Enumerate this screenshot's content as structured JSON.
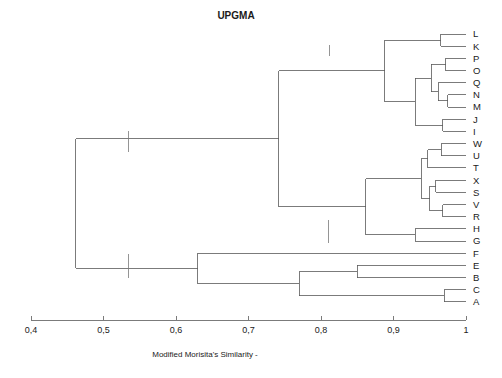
{
  "chart_data": {
    "type": "dendrogram",
    "title": "UPGMA",
    "xlabel": "Modified Morisita's Similarity -",
    "ylabel": "",
    "xlim": [
      0.4,
      1.0
    ],
    "xticks": [
      0.4,
      0.5,
      0.6,
      0.7,
      0.8,
      0.9,
      1.0
    ],
    "xtick_labels": [
      "0,4",
      "0,5",
      "0,6",
      "0,7",
      "0,8",
      "0,9",
      "1"
    ],
    "grid": false,
    "legend": "none",
    "axis_direction": "similarity-increasing-rightward",
    "leaves": [
      "L",
      "K",
      "P",
      "O",
      "Q",
      "N",
      "M",
      "J",
      "I",
      "W",
      "U",
      "T",
      "X",
      "S",
      "V",
      "R",
      "H",
      "G",
      "F",
      "E",
      "B",
      "C",
      "A"
    ],
    "leaf_count": 23,
    "merges": [
      {
        "id": "m_LK",
        "children": [
          "L",
          "K"
        ],
        "similarity": 0.965
      },
      {
        "id": "m_PO",
        "children": [
          "P",
          "O"
        ],
        "similarity": 0.972
      },
      {
        "id": "m_NM",
        "children": [
          "N",
          "M"
        ],
        "similarity": 0.975
      },
      {
        "id": "m_QNM",
        "children": [
          "Q",
          "m_NM"
        ],
        "similarity": 0.962
      },
      {
        "id": "m_PONM",
        "children": [
          "m_PO",
          "m_QNM"
        ],
        "similarity": 0.952
      },
      {
        "id": "m_JI",
        "children": [
          "J",
          "I"
        ],
        "similarity": 0.968
      },
      {
        "id": "m_PONMJI",
        "children": [
          "m_PONM",
          "m_JI"
        ],
        "similarity": 0.93
      },
      {
        "id": "m_IIa",
        "children": [
          "m_LK",
          "m_PONMJI"
        ],
        "similarity": 0.888
      },
      {
        "id": "m_WU",
        "children": [
          "W",
          "U"
        ],
        "similarity": 0.966
      },
      {
        "id": "m_WUT",
        "children": [
          "m_WU",
          "T"
        ],
        "similarity": 0.947
      },
      {
        "id": "m_XS",
        "children": [
          "X",
          "S"
        ],
        "similarity": 0.958
      },
      {
        "id": "m_VR",
        "children": [
          "V",
          "R"
        ],
        "similarity": 0.968
      },
      {
        "id": "m_XSVR",
        "children": [
          "m_XS",
          "m_VR"
        ],
        "similarity": 0.95
      },
      {
        "id": "m_WUTXSVR",
        "children": [
          "m_WUT",
          "m_XSVR"
        ],
        "similarity": 0.938
      },
      {
        "id": "m_HG",
        "children": [
          "H",
          "G"
        ],
        "similarity": 0.93
      },
      {
        "id": "m_IIb",
        "children": [
          "m_WUTXSVR",
          "m_HG"
        ],
        "similarity": 0.862
      },
      {
        "id": "m_II",
        "children": [
          "m_IIa",
          "m_IIb"
        ],
        "similarity": 0.742
      },
      {
        "id": "m_EB",
        "children": [
          "E",
          "B"
        ],
        "similarity": 0.85
      },
      {
        "id": "m_CA",
        "children": [
          "C",
          "A"
        ],
        "similarity": 0.97
      },
      {
        "id": "m_EBCA",
        "children": [
          "m_EB",
          "m_CA"
        ],
        "similarity": 0.77
      },
      {
        "id": "m_I",
        "children": [
          "F",
          "m_EBCA"
        ],
        "similarity": 0.63
      },
      {
        "id": "m_root",
        "children": [
          "m_II",
          "m_I"
        ],
        "similarity": 0.462
      }
    ],
    "annotations": [
      {
        "name": "group-ii-a",
        "text": "Group II a  \" Punta Carretas zone\"",
        "anchor_x": 0.812,
        "label_x": 0.7,
        "label_y_px": 42,
        "tick_y1_px": 45,
        "tick_y2_px": 56,
        "align": "middle"
      },
      {
        "name": "group-ii",
        "text": "Group II",
        "anchor_x": 0.534,
        "label_x": 0.534,
        "label_y_px": 126,
        "tick_y1_px": 131,
        "tick_y2_px": 152,
        "align": "middle"
      },
      {
        "name": "group-ii-b",
        "text": "Group II b  \" Punta Yeguas zone\"",
        "anchor_x": 0.81,
        "label_x": 0.695,
        "label_y_px": 216,
        "tick_y1_px": 220,
        "tick_y2_px": 243,
        "align": "middle"
      },
      {
        "name": "group-i",
        "text": "Group I \"Inner Bay zone\"",
        "anchor_x": 0.535,
        "label_x": 0.528,
        "label_y_px": 249,
        "tick_y1_px": 254,
        "tick_y2_px": 278,
        "align": "middle"
      }
    ]
  },
  "figure": {
    "title": "UPGMA",
    "axis_title": "Modified Morisita's Similarity -"
  }
}
